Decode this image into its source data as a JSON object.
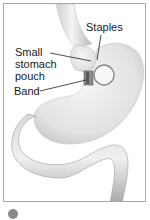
{
  "figure": {
    "labels": {
      "staples": "Staples",
      "pouch_line1": "Small",
      "pouch_line2": "stomach",
      "pouch_line3": "pouch",
      "band": "Band"
    },
    "colors": {
      "border": "#a8a8a8",
      "organ_fill": "#e6e6e6",
      "organ_shade": "#bdbdbd",
      "leader_line": "#222222",
      "band_fill": "#8c8c8c"
    }
  },
  "caption": {
    "icon": "circled-number-icon"
  }
}
